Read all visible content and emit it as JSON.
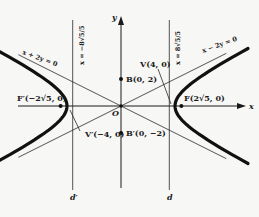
{
  "diagram": {
    "type": "hyperbola",
    "equation_semi_axes": {
      "a": 4,
      "b": 2
    },
    "axes": {
      "x_label": "x",
      "y_label": "y",
      "origin_label": "O"
    },
    "asymptotes": [
      {
        "id": "asym-pos",
        "label": "x − 2y = 0",
        "slope": 0.5
      },
      {
        "id": "asym-neg",
        "label": "x + 2y = 0",
        "slope": -0.5
      }
    ],
    "directrices": [
      {
        "id": "d-left",
        "label": "d′",
        "eq_label": "x = −8√5/5",
        "x": -3.5777
      },
      {
        "id": "d-right",
        "label": "d",
        "eq_label": "x = 8√5/5",
        "x": 3.5777
      }
    ],
    "points": [
      {
        "id": "F",
        "label": "F(2√5, 0)",
        "x": 4.4721,
        "y": 0
      },
      {
        "id": "F-prime",
        "label": "F′(−2√5, 0)",
        "x": -4.4721,
        "y": 0
      },
      {
        "id": "V",
        "label": "V(4, 0)",
        "x": 4,
        "y": 0
      },
      {
        "id": "V-prime",
        "label": "V′(−4, 0)",
        "x": -4,
        "y": 0
      },
      {
        "id": "B",
        "label": "B(0, 2)",
        "x": 0,
        "y": 2
      },
      {
        "id": "B-prime",
        "label": "B′(0, −2)",
        "x": 0,
        "y": -2
      }
    ]
  }
}
